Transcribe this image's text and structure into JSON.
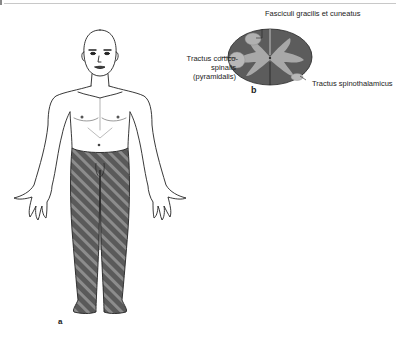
{
  "figure": {
    "panel_a": {
      "letter": "a",
      "description": "Anterior view of human body with hatched (affected) region from lower abdomen/groin down through both legs and feet"
    },
    "panel_b": {
      "letter": "b",
      "description": "Spinal cord cross-section with shaded tracts",
      "labels": {
        "dorsal_columns": "Fasciculi gracilis et cuneatus",
        "corticospinal_line1": "Tractus cortico-",
        "corticospinal_line2": "spinalis",
        "corticospinal_line3": "(pyramidalis)",
        "spinothalamic": "Tractus spinothalamicus"
      }
    }
  },
  "colors": {
    "hatch_dark": "#5a5a5a",
    "hatch_light": "#8a8a8a",
    "cord_dark": "#5c5c5c",
    "cord_light": "#a8a8a8",
    "outline": "#222222"
  }
}
